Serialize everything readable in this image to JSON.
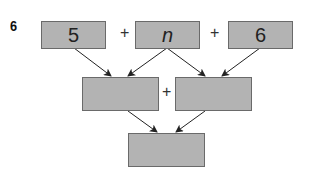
{
  "problem": {
    "number": "6"
  },
  "diagram": {
    "top_row": [
      {
        "value": "5"
      },
      {
        "value": "n"
      },
      {
        "value": "6"
      }
    ],
    "top_operators": [
      "+",
      "+"
    ],
    "middle_row": [
      {
        "value": ""
      },
      {
        "value": ""
      }
    ],
    "middle_operator": "+",
    "bottom_row": [
      {
        "value": ""
      }
    ]
  },
  "colors": {
    "box_fill": "#b3b3b3",
    "box_border": "#6a6a6a",
    "arrow": "#222222"
  }
}
